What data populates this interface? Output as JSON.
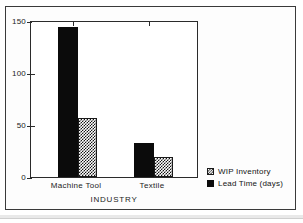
{
  "figure": {
    "background_color": "#ffffff",
    "frame_color": "#3a3a3a"
  },
  "chart_data": {
    "type": "bar",
    "title": "",
    "subtitle": "",
    "categories": [
      "Machine Tool",
      "Textile"
    ],
    "series": [
      {
        "name": "Lead Time (days)",
        "values": [
          145,
          33
        ],
        "fill": "solid",
        "color": "#0b0b0b"
      },
      {
        "name": "WIP Inventory",
        "values": [
          57,
          19
        ],
        "fill": "hatch",
        "color": "#141414"
      }
    ],
    "xlabel": "INDUSTRY",
    "ylabel": "",
    "ylim": [
      0,
      150
    ],
    "yticks": [
      0,
      50,
      100,
      150
    ],
    "ytick_labels": [
      "0",
      "50",
      "100",
      "150"
    ],
    "grid": false,
    "legend_position": "right-bottom-outside"
  },
  "axes": {
    "y_tick_labels": [
      "150",
      "100",
      "50",
      "0"
    ],
    "x_tick_labels": [
      "Machine Tool",
      "Textile"
    ],
    "x_axis_title": "INDUSTRY"
  },
  "legend": {
    "entries": [
      {
        "label": "WIP Inventory",
        "swatch": "hatched-square-icon"
      },
      {
        "label": "Lead Time (days)",
        "swatch": "solid-square-icon"
      }
    ]
  }
}
